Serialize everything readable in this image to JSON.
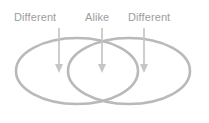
{
  "diagram": {
    "type": "venn-two-set-with-annotations",
    "background_color": "#ffffff",
    "stroke_color": "#b9b9b9",
    "arrow_color": "#c2c2c2",
    "text_color": "#9d9d9d",
    "labels": [
      {
        "id": "left",
        "text": "Different",
        "target": "left-circle-only-region"
      },
      {
        "id": "mid",
        "text": "Alike",
        "target": "overlap-region"
      },
      {
        "id": "right",
        "text": "Different",
        "target": "right-circle-only-region"
      }
    ],
    "arrows": [
      {
        "id": "left-arrow",
        "x": 59,
        "y_start": 28,
        "y_end": 72
      },
      {
        "id": "mid-arrow",
        "x": 102,
        "y_start": 28,
        "y_end": 72
      },
      {
        "id": "right-arrow",
        "x": 144,
        "y_start": 28,
        "y_end": 72
      }
    ],
    "circles": [
      {
        "id": "left-circle",
        "cx": 77,
        "cy": 71,
        "rx": 61,
        "ry": 33
      },
      {
        "id": "right-circle",
        "cx": 129,
        "cy": 71,
        "rx": 61,
        "ry": 33
      }
    ]
  }
}
